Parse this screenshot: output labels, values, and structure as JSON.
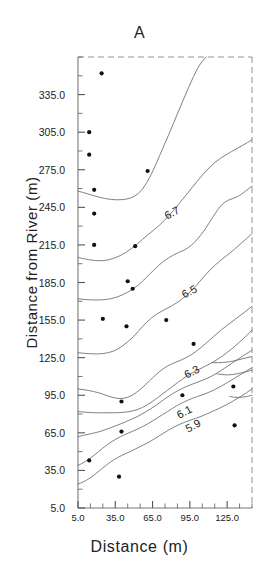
{
  "chart_data": {
    "type": "line",
    "subtype": "contour-map-with-scatter",
    "title": "A",
    "xlabel": "Distance  (m)",
    "ylabel": "Distance from River  (m)",
    "xlim": [
      5.0,
      145.0
    ],
    "ylim": [
      5.0,
      365.0
    ],
    "grid": false,
    "legend": "none",
    "xticklabels": [
      "5.0",
      "35.0",
      "65.0",
      "95.0",
      "125.0"
    ],
    "xtickvalues": [
      5.0,
      35.0,
      65.0,
      95.0,
      125.0
    ],
    "xminortickvalues": [
      5,
      15,
      25,
      35,
      45,
      55,
      65,
      75,
      85,
      95,
      105,
      115,
      125,
      135,
      145
    ],
    "yticklabels": [
      "335.0",
      "305.0",
      "275.0",
      "245.0",
      "215.0",
      "185.0",
      "155.0",
      "125.0",
      "95.0",
      "65.0",
      "35.0",
      "5.0"
    ],
    "ytickvalues": [
      335.0,
      305.0,
      275.0,
      245.0,
      215.0,
      185.0,
      155.0,
      125.0,
      95.0,
      65.0,
      35.0,
      5.0
    ],
    "yminortickvalues": [
      5,
      20,
      35,
      50,
      65,
      80,
      95,
      110,
      125,
      140,
      155,
      170,
      185,
      200,
      215,
      230,
      245,
      260,
      275,
      290,
      305,
      320,
      335,
      350,
      365
    ],
    "contour_levels": [
      5.9,
      6.1,
      6.3,
      6.5,
      6.7
    ],
    "contour_labels": [
      "6.7",
      "6.5",
      "6.3",
      "6.1",
      "5.9"
    ],
    "contour_label_positions": [
      {
        "label": "6.7",
        "x": 82,
        "y": 238
      },
      {
        "label": "6.5",
        "x": 96,
        "y": 175
      },
      {
        "label": "6.3",
        "x": 98,
        "y": 111
      },
      {
        "label": "6.1",
        "x": 92,
        "y": 79
      },
      {
        "label": "5.9",
        "x": 99,
        "y": 68
      }
    ],
    "contours": [
      {
        "level": 6.7,
        "points": [
          [
            5,
            258
          ],
          [
            12,
            256
          ],
          [
            22,
            253
          ],
          [
            32,
            251
          ],
          [
            42,
            251
          ],
          [
            50,
            253
          ],
          [
            57,
            259
          ],
          [
            64,
            271
          ],
          [
            71,
            287
          ],
          [
            78,
            303
          ],
          [
            86,
            322
          ],
          [
            94,
            341
          ],
          [
            102,
            358
          ],
          [
            108,
            365
          ]
        ]
      },
      {
        "level": 6.7,
        "points": [
          [
            5,
            205
          ],
          [
            14,
            203
          ],
          [
            24,
            202
          ],
          [
            34,
            204
          ],
          [
            44,
            209
          ],
          [
            53,
            216
          ],
          [
            61,
            223
          ],
          [
            70,
            230
          ],
          [
            79,
            239
          ],
          [
            88,
            250
          ],
          [
            97,
            261
          ],
          [
            106,
            272
          ],
          [
            115,
            281
          ],
          [
            124,
            287
          ],
          [
            133,
            292
          ],
          [
            142,
            297
          ],
          [
            145,
            299
          ]
        ]
      },
      {
        "level": 6.5,
        "points": [
          [
            5,
            172
          ],
          [
            15,
            171
          ],
          [
            26,
            171
          ],
          [
            36,
            173
          ],
          [
            45,
            177
          ],
          [
            54,
            183
          ],
          [
            62,
            191
          ],
          [
            70,
            199
          ],
          [
            78,
            205
          ],
          [
            86,
            209
          ],
          [
            93,
            212
          ],
          [
            100,
            218
          ],
          [
            107,
            227
          ],
          [
            114,
            238
          ],
          [
            120,
            247
          ],
          [
            126,
            251
          ],
          [
            133,
            253
          ],
          [
            140,
            258
          ],
          [
            145,
            262
          ]
        ]
      },
      {
        "level": 6.5,
        "points": [
          [
            5,
            129
          ],
          [
            15,
            128
          ],
          [
            25,
            128
          ],
          [
            34,
            130
          ],
          [
            42,
            135
          ],
          [
            50,
            142
          ],
          [
            57,
            150
          ],
          [
            64,
            157
          ],
          [
            72,
            162
          ],
          [
            80,
            166
          ],
          [
            88,
            171
          ],
          [
            96,
            178
          ],
          [
            104,
            187
          ],
          [
            112,
            196
          ],
          [
            120,
            203
          ],
          [
            128,
            209
          ],
          [
            136,
            216
          ],
          [
            145,
            224
          ]
        ]
      },
      {
        "level": 6.3,
        "points": [
          [
            5,
            100
          ],
          [
            13,
            99
          ],
          [
            22,
            97
          ],
          [
            30,
            94
          ],
          [
            38,
            92
          ],
          [
            45,
            93
          ],
          [
            52,
            97
          ],
          [
            59,
            103
          ],
          [
            66,
            110
          ],
          [
            73,
            116
          ],
          [
            80,
            120
          ],
          [
            88,
            123
          ],
          [
            96,
            127
          ],
          [
            104,
            133
          ],
          [
            112,
            140
          ],
          [
            120,
            147
          ],
          [
            128,
            153
          ],
          [
            136,
            159
          ],
          [
            145,
            166
          ]
        ]
      },
      {
        "level": 6.3,
        "points": [
          [
            5,
            82
          ],
          [
            16,
            81
          ],
          [
            27,
            81
          ],
          [
            38,
            81
          ],
          [
            48,
            82
          ],
          [
            57,
            85
          ],
          [
            65,
            90
          ],
          [
            73,
            96
          ],
          [
            81,
            102
          ],
          [
            89,
            108
          ],
          [
            97,
            113
          ],
          [
            105,
            117
          ],
          [
            113,
            121
          ],
          [
            121,
            126
          ],
          [
            130,
            133
          ],
          [
            138,
            140
          ],
          [
            145,
            147
          ]
        ]
      },
      {
        "level": 6.1,
        "points": [
          [
            5,
            62
          ],
          [
            14,
            64
          ],
          [
            23,
            66
          ],
          [
            31,
            69
          ],
          [
            39,
            72
          ],
          [
            46,
            75
          ],
          [
            53,
            78
          ],
          [
            60,
            82
          ],
          [
            68,
            87
          ],
          [
            76,
            93
          ],
          [
            84,
            98
          ],
          [
            92,
            102
          ],
          [
            100,
            105
          ],
          [
            108,
            108
          ],
          [
            116,
            112
          ],
          [
            125,
            118
          ],
          [
            134,
            124
          ],
          [
            145,
            131
          ]
        ]
      },
      {
        "level": 5.9,
        "points": [
          [
            5,
            39
          ],
          [
            11,
            42
          ],
          [
            18,
            47
          ],
          [
            25,
            53
          ],
          [
            32,
            58
          ],
          [
            39,
            62
          ],
          [
            46,
            65
          ],
          [
            53,
            68
          ],
          [
            61,
            72
          ],
          [
            69,
            77
          ],
          [
            77,
            82
          ],
          [
            85,
            87
          ],
          [
            93,
            91
          ],
          [
            101,
            94
          ],
          [
            110,
            97
          ],
          [
            120,
            102
          ],
          [
            130,
            108
          ],
          [
            145,
            117
          ]
        ]
      },
      {
        "level": 5.9,
        "points": [
          [
            5,
            24
          ],
          [
            12,
            27
          ],
          [
            19,
            32
          ],
          [
            26,
            38
          ],
          [
            33,
            43
          ],
          [
            40,
            47
          ],
          [
            47,
            50
          ],
          [
            55,
            54
          ],
          [
            63,
            58
          ],
          [
            71,
            63
          ],
          [
            79,
            68
          ],
          [
            87,
            72
          ],
          [
            95,
            75
          ],
          [
            104,
            78
          ],
          [
            113,
            82
          ],
          [
            124,
            87
          ],
          [
            136,
            94
          ],
          [
            145,
            100
          ]
        ]
      },
      {
        "level": 6.1,
        "points": [
          [
            113,
            121
          ],
          [
            121,
            121
          ],
          [
            129,
            122
          ],
          [
            137,
            124
          ],
          [
            145,
            126
          ]
        ]
      },
      {
        "level": 6.1,
        "points": [
          [
            117,
            112
          ],
          [
            125,
            111
          ],
          [
            133,
            112
          ],
          [
            141,
            114
          ],
          [
            145,
            115
          ]
        ]
      },
      {
        "level": 5.9,
        "points": [
          [
            127,
            94
          ],
          [
            134,
            93
          ],
          [
            141,
            94
          ],
          [
            145,
            95
          ]
        ]
      }
    ],
    "scatter_points": [
      {
        "x": 24,
        "y": 352
      },
      {
        "x": 14,
        "y": 305
      },
      {
        "x": 14,
        "y": 287
      },
      {
        "x": 61,
        "y": 274
      },
      {
        "x": 18,
        "y": 259
      },
      {
        "x": 18,
        "y": 240
      },
      {
        "x": 18,
        "y": 215
      },
      {
        "x": 51,
        "y": 214
      },
      {
        "x": 45,
        "y": 186
      },
      {
        "x": 49,
        "y": 180
      },
      {
        "x": 25,
        "y": 156
      },
      {
        "x": 44,
        "y": 150
      },
      {
        "x": 76,
        "y": 155
      },
      {
        "x": 98,
        "y": 136
      },
      {
        "x": 40,
        "y": 90
      },
      {
        "x": 89,
        "y": 95
      },
      {
        "x": 130,
        "y": 102
      },
      {
        "x": 40,
        "y": 66
      },
      {
        "x": 131,
        "y": 71
      },
      {
        "x": 14,
        "y": 43
      },
      {
        "x": 38,
        "y": 30
      }
    ]
  },
  "axes": {
    "title": "A",
    "x_title": "Distance  (m)",
    "y_title": "Distance from River  (m)"
  }
}
